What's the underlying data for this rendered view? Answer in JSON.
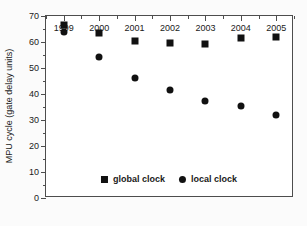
{
  "chart_data": {
    "type": "scatter",
    "title": "",
    "subtitle": "",
    "xlabel": "",
    "ylabel": "MPU cycle (gate delay units)",
    "categories": [
      "1999",
      "2000",
      "2001",
      "2002",
      "2003",
      "2004",
      "2005"
    ],
    "x": [
      1999,
      2000,
      2001,
      2002,
      2003,
      2004,
      2005
    ],
    "series": [
      {
        "name": "global clock",
        "marker": "square",
        "color": "#111111",
        "values": [
          66.5,
          63.5,
          60.5,
          59.7,
          59.2,
          61.5,
          61.8
        ]
      },
      {
        "name": "local clock",
        "marker": "circle",
        "color": "#111111",
        "values": [
          64.0,
          54.3,
          46.2,
          41.5,
          37.2,
          35.2,
          32.0
        ]
      }
    ],
    "ylim": [
      0,
      70
    ],
    "y_major_ticks": [
      0,
      10,
      20,
      30,
      40,
      50,
      60,
      70
    ],
    "y_minor_ticks": [
      5,
      15,
      25,
      35,
      45,
      55,
      65
    ],
    "y_tick_labels": [
      "0",
      "10",
      "20",
      "30",
      "40",
      "50",
      "60",
      "70"
    ],
    "grid": false,
    "legend_position": "bottom-center-inside",
    "legend_entries": [
      {
        "label": "global clock",
        "marker": "square"
      },
      {
        "label": "local clock",
        "marker": "circle"
      }
    ],
    "frame": {
      "left": 45,
      "top": 15,
      "width": 248,
      "height": 182
    }
  }
}
